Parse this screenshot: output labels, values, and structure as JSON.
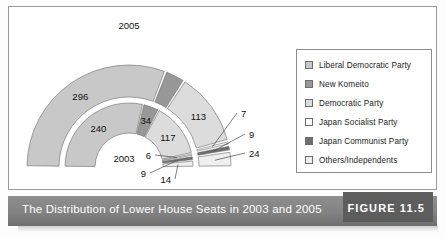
{
  "figure": {
    "caption": "The Distribution of Lower House Seats in 2003 and 2005",
    "tag": "FIGURE 11.5"
  },
  "legend": {
    "items": [
      {
        "label": "Liberal Democratic Party",
        "color": "#c8c8c8",
        "swatch_name": "legend-swatch-ldp"
      },
      {
        "label": "New Komeito",
        "color": "#989898",
        "swatch_name": "legend-swatch-komeito"
      },
      {
        "label": "Democratic Party",
        "color": "#dcdcdc",
        "swatch_name": "legend-swatch-dpj"
      },
      {
        "label": "Japan Socialist Party",
        "color": "#fbfbfb",
        "swatch_name": "legend-swatch-jsp"
      },
      {
        "label": "Japan Communist Party",
        "color": "#6e6e6e",
        "swatch_name": "legend-swatch-jcp"
      },
      {
        "label": "Others/Independents",
        "color": "#efefef",
        "swatch_name": "legend-swatch-others"
      }
    ]
  },
  "rings": {
    "outer_year_label": "2005",
    "inner_year_label": "2003"
  },
  "chart_data": {
    "type": "pie",
    "title": "The Distribution of Lower House Seats in 2003 and 2005",
    "subtype": "double-ring half-donut",
    "total_seats": 480,
    "legend_position": "right",
    "grid": false,
    "series": [
      {
        "name": "2005",
        "ring": "outer",
        "labels": [
          "296",
          "31",
          "113",
          "7",
          "9",
          "24"
        ],
        "categories": [
          "Liberal Democratic Party",
          "New Komeito",
          "Democratic Party",
          "Japan Socialist Party",
          "Japan Communist Party",
          "Others/Independents"
        ],
        "values": [
          296,
          31,
          113,
          7,
          9,
          24
        ]
      },
      {
        "name": "2003",
        "ring": "inner",
        "labels": [
          "240",
          "34",
          "117",
          "6",
          "9",
          "14"
        ],
        "categories": [
          "Liberal Democratic Party",
          "New Komeito",
          "Democratic Party",
          "Japan Socialist Party",
          "Japan Communist Party",
          "Others/Independents"
        ],
        "values": [
          240,
          34,
          117,
          6,
          9,
          14
        ]
      }
    ],
    "callouts_outer": [
      "7",
      "9",
      "24"
    ],
    "callouts_inner": [
      "6",
      "9",
      "14"
    ]
  }
}
